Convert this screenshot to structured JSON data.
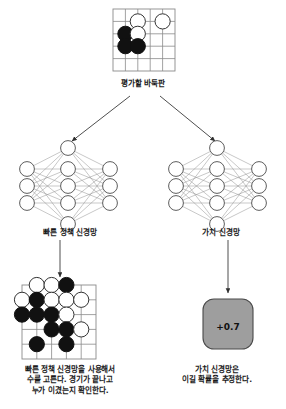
{
  "figure": {
    "title_caption": "평가할 바둑판",
    "policy_caption": "빠른 정책 신경망",
    "value_caption": "가치 신경망",
    "rollout_caption": "빠른 정책 신경망을 사용해서\n수를 고른다. 경기가 끝나고\n누가 이겼는지 확인한다.",
    "evaluation_caption": "가치 신경망은\n이길 확률을 추정한다.",
    "value_score": "+0.7"
  },
  "colors": {
    "background": "#ffffff",
    "line": "#6e6e6e",
    "board_line": "#8a8a8a",
    "black_stone": "#111111",
    "white_stone": "#ffffff",
    "stone_outline": "#333333",
    "arrow": "#3a3a3a",
    "value_box_fill": "#9e9e9e",
    "value_box_stroke": "#4a4a4a",
    "text": "#1a1a1a"
  },
  "boards": {
    "top": {
      "name": "position-to-evaluate-board",
      "grid_size": 5,
      "stones": [
        {
          "col": 2,
          "row": 1,
          "color": "white"
        },
        {
          "col": 4,
          "row": 1,
          "color": "white"
        },
        {
          "col": 1,
          "row": 2,
          "color": "black"
        },
        {
          "col": 2,
          "row": 2,
          "color": "white"
        },
        {
          "col": 1,
          "row": 3,
          "color": "black"
        },
        {
          "col": 2,
          "row": 3,
          "color": "black"
        }
      ]
    },
    "rollout": {
      "name": "rollout-result-board",
      "grid_size": 6,
      "stones": [
        {
          "col": 1,
          "row": 0,
          "color": "white"
        },
        {
          "col": 2,
          "row": 0,
          "color": "white"
        },
        {
          "col": 3,
          "row": 0,
          "color": "black"
        },
        {
          "col": 0,
          "row": 1,
          "color": "white"
        },
        {
          "col": 1,
          "row": 1,
          "color": "black"
        },
        {
          "col": 2,
          "row": 1,
          "color": "white"
        },
        {
          "col": 3,
          "row": 1,
          "color": "white"
        },
        {
          "col": 4,
          "row": 1,
          "color": "white"
        },
        {
          "col": 0,
          "row": 2,
          "color": "black"
        },
        {
          "col": 1,
          "row": 2,
          "color": "black"
        },
        {
          "col": 2,
          "row": 2,
          "color": "black"
        },
        {
          "col": 3,
          "row": 2,
          "color": "white"
        },
        {
          "col": 2,
          "row": 3,
          "color": "black"
        },
        {
          "col": 3,
          "row": 3,
          "color": "black"
        },
        {
          "col": 4,
          "row": 3,
          "color": "white"
        },
        {
          "col": 1,
          "row": 4,
          "color": "black"
        },
        {
          "col": 3,
          "row": 4,
          "color": "black"
        }
      ]
    }
  },
  "networks": {
    "policy": {
      "name": "fast-policy-network",
      "layers": [
        3,
        5,
        3
      ]
    },
    "value": {
      "name": "value-network",
      "layers": [
        3,
        5,
        3
      ]
    }
  }
}
